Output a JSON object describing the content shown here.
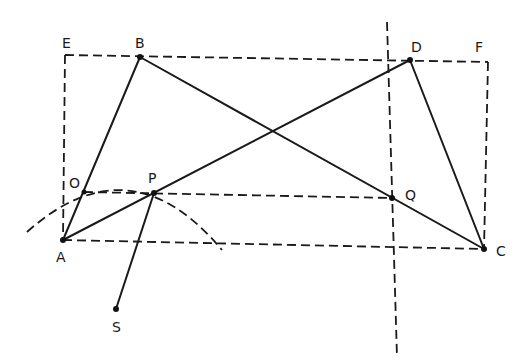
{
  "diagram": {
    "type": "geometric-construction",
    "points": {
      "A": {
        "label": "A",
        "x": 63,
        "y": 240
      },
      "B": {
        "label": "B",
        "x": 140,
        "y": 57
      },
      "C": {
        "label": "C",
        "x": 484,
        "y": 249
      },
      "D": {
        "label": "D",
        "x": 410,
        "y": 60
      },
      "E": {
        "label": "E",
        "x": 65,
        "y": 55
      },
      "F": {
        "label": "F",
        "x": 488,
        "y": 62
      },
      "O": {
        "label": "O",
        "x": 84,
        "y": 192
      },
      "P": {
        "label": "P",
        "x": 154,
        "y": 193
      },
      "Q": {
        "label": "Q",
        "x": 392,
        "y": 198
      },
      "S": {
        "label": "S",
        "x": 116,
        "y": 309
      }
    },
    "solid_segments": [
      "AB",
      "BC",
      "AD",
      "DC",
      "AP",
      "PS"
    ],
    "dashed_segments": [
      "EF",
      "EA",
      "FC",
      "AC",
      "OQ",
      "vertical line through Q"
    ],
    "arc": "dashed arc centered at A through O and P"
  }
}
